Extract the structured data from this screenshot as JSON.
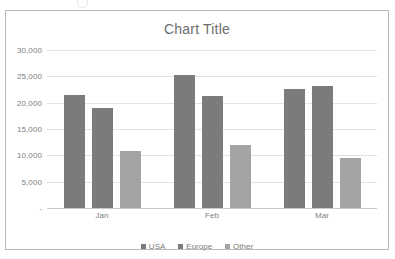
{
  "chart_data": {
    "type": "bar",
    "title": "Chart Title",
    "xlabel": "",
    "ylabel": "",
    "categories": [
      "Jan",
      "Feb",
      "Mar"
    ],
    "series": [
      {
        "name": "USA",
        "color": "#7b7b7b",
        "values": [
          21400,
          25300,
          22600
        ]
      },
      {
        "name": "Europe",
        "color": "#7b7b7b",
        "values": [
          19000,
          21200,
          23200
        ]
      },
      {
        "name": "Other",
        "color": "#a4a4a4",
        "values": [
          10800,
          12000,
          9500
        ]
      }
    ],
    "ylim": [
      0,
      30000
    ],
    "y_ticks": [
      {
        "value": 30000,
        "label": "30,000"
      },
      {
        "value": 25000,
        "label": "25,000"
      },
      {
        "value": 20000,
        "label": "20,000"
      },
      {
        "value": 15000,
        "label": "15,000"
      },
      {
        "value": 10000,
        "label": "10,000"
      },
      {
        "value": 5000,
        "label": "5,000"
      },
      {
        "value": 0,
        "label": "-"
      }
    ],
    "grid": true,
    "legend_position": "bottom",
    "plot_background": "#ffffff",
    "grid_color": "#e2e2e2",
    "text_color": "#7d7d7d"
  }
}
